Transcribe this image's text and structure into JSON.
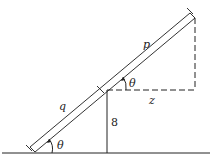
{
  "diagram": {
    "labels": {
      "p": "p",
      "q": "q",
      "theta_bottom": "θ",
      "theta_top": "θ",
      "z": "z",
      "height": "8"
    },
    "colors": {
      "stroke": "#222222",
      "background": "#ffffff"
    }
  }
}
